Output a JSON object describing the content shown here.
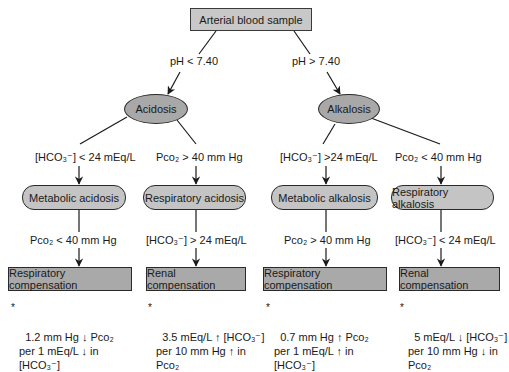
{
  "root": {
    "label": "Arterial blood sample"
  },
  "branches": {
    "left_condition": "pH < 7.40",
    "right_condition": "pH > 7.40"
  },
  "states": {
    "acidosis": "Acidosis",
    "alkalosis": "Alkalosis"
  },
  "criteria_level1": [
    {
      "id": "metabolic-acidosis",
      "text": "[HCO₃⁻] < 24 mEq/L"
    },
    {
      "id": "respiratory-acidosis",
      "text": "Pco₂ > 40 mm Hg"
    },
    {
      "id": "metabolic-alkalosis",
      "text": "[HCO₃⁻] >24 mEq/L"
    },
    {
      "id": "respiratory-alkalosis",
      "text": "Pco₂ < 40 mm Hg"
    }
  ],
  "disorders": [
    {
      "label": "Metabolic acidosis"
    },
    {
      "label": "Respiratory acidosis"
    },
    {
      "label": "Metabolic alkalosis"
    },
    {
      "label": "Respiratory alkalosis"
    }
  ],
  "criteria_level2": [
    {
      "text": "Pco₂ < 40 mm Hg"
    },
    {
      "text": "[HCO₃⁻] > 24 mEq/L"
    },
    {
      "text": "Pco₂ > 40 mm Hg"
    },
    {
      "text": "[HCO₃⁻] < 24 mEq/L"
    }
  ],
  "compensations": [
    {
      "label": "Respiratory compensation"
    },
    {
      "label": "Renal compensation"
    },
    {
      "label": "Respiratory compensation"
    },
    {
      "label": "Renal compensation"
    }
  ],
  "notes": [
    {
      "bullet": "*",
      "text": "1.2 mm Hg ↓ Pco₂\nper 1 mEq/L ↓ in\n[HCO₃⁻]"
    },
    {
      "bullet": "*",
      "text": "3.5 mEq/L ↑ [HCO₃⁻]\nper 10 mm Hg ↑ in\nPco₂"
    },
    {
      "bullet": "*",
      "text": "0.7 mm Hg ↑ Pco₂\nper 1 mEq/L ↑ in\n[HCO₃⁻]"
    },
    {
      "bullet": "*",
      "text": "5 mEq/L ↓ [HCO₃⁻]\nper 10 mm Hg ↓ in\nPco₂"
    }
  ],
  "colors": {
    "root_fill": "#c8c8c8",
    "ellipse_fill": "#a8a8a8",
    "pill_fill": "#c4c4c4",
    "compensation_fill": "#a9a9a9",
    "line": "#1a1a1a"
  }
}
